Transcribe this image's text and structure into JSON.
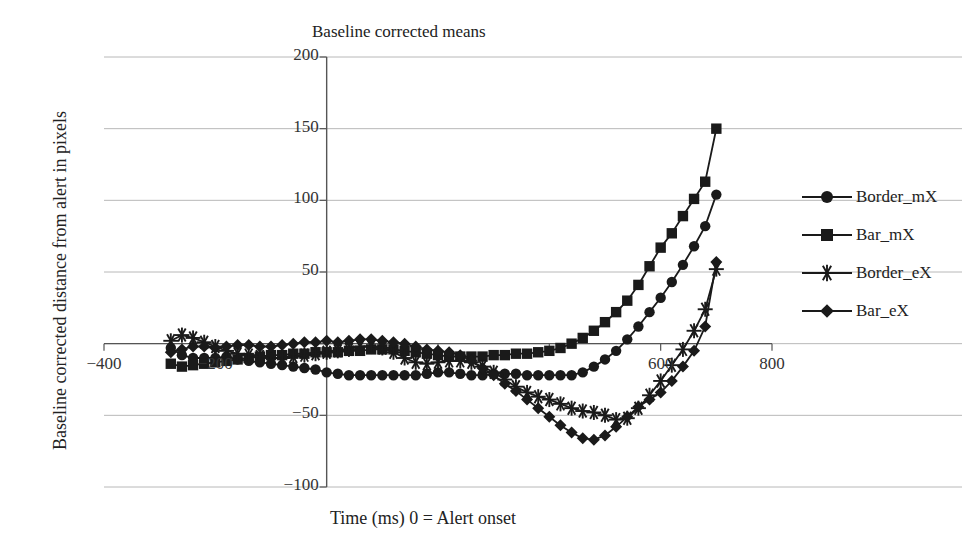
{
  "chart_data": {
    "type": "line",
    "title": "Baseline corrected means",
    "xlabel": "Time (ms) 0 = Alert onset",
    "ylabel": "Baseline corrected distance from alert in pixels",
    "xlim": [
      -400,
      800
    ],
    "ylim": [
      -100,
      200
    ],
    "xticks": [
      -400,
      -200,
      0,
      200,
      400,
      600,
      800
    ],
    "xtick_labels": [
      "-400",
      "-200",
      "",
      "",
      "",
      "600",
      "800"
    ],
    "yticks": [
      -100,
      -50,
      0,
      50,
      100,
      150,
      200
    ],
    "ytick_labels": [
      "-100",
      "-50",
      "",
      "50",
      "100",
      "150",
      "200"
    ],
    "grid": true,
    "legend_position": "right",
    "x": [
      -280,
      -260,
      -240,
      -220,
      -200,
      -180,
      -160,
      -140,
      -120,
      -100,
      -80,
      -60,
      -40,
      -20,
      0,
      20,
      40,
      60,
      80,
      100,
      120,
      140,
      160,
      180,
      200,
      220,
      240,
      260,
      280,
      300,
      320,
      340,
      360,
      380,
      400,
      420,
      440,
      460,
      480,
      500,
      520,
      540,
      560,
      580,
      600,
      620,
      640,
      660,
      680,
      700
    ],
    "series": [
      {
        "name": "Border_mX",
        "marker": "circle",
        "values": [
          -3,
          -8,
          -10,
          -10,
          -10,
          -9,
          -11,
          -12,
          -13,
          -14,
          -15,
          -16,
          -17,
          -18,
          -20,
          -21,
          -22,
          -22,
          -22,
          -22,
          -22,
          -22,
          -22,
          -21,
          -20,
          -20,
          -21,
          -22,
          -22,
          -21,
          -21,
          -21,
          -22,
          -22,
          -22,
          -22,
          -22,
          -20,
          -16,
          -11,
          -5,
          3,
          12,
          22,
          32,
          43,
          55,
          68,
          82,
          104
        ]
      },
      {
        "name": "Bar_mX",
        "marker": "square",
        "values": [
          -14,
          -16,
          -15,
          -14,
          -13,
          -12,
          -11,
          -10,
          -9,
          -8,
          -8,
          -7,
          -7,
          -6,
          -6,
          -6,
          -5,
          -5,
          -4,
          -4,
          -4,
          -5,
          -6,
          -7,
          -8,
          -9,
          -9,
          -9,
          -9,
          -8,
          -8,
          -7,
          -7,
          -6,
          -5,
          -3,
          0,
          4,
          9,
          15,
          22,
          30,
          41,
          54,
          67,
          77,
          89,
          101,
          113,
          150
        ]
      },
      {
        "name": "Border_eX",
        "marker": "star",
        "values": [
          2,
          6,
          4,
          1,
          -2,
          -5,
          -7,
          -8,
          -9,
          -10,
          -10,
          -9,
          -8,
          -7,
          -6,
          -5,
          -4,
          -2,
          -2,
          -3,
          -6,
          -10,
          -13,
          -14,
          -13,
          -12,
          -12,
          -13,
          -16,
          -20,
          -25,
          -30,
          -34,
          -37,
          -39,
          -42,
          -45,
          -47,
          -48,
          -50,
          -53,
          -52,
          -45,
          -36,
          -26,
          -15,
          -4,
          9,
          24,
          52
        ]
      },
      {
        "name": "Bar_eX",
        "marker": "diamond",
        "values": [
          -6,
          -4,
          -2,
          -2,
          -3,
          -2,
          -1,
          -1,
          -2,
          -2,
          -1,
          0,
          1,
          1,
          2,
          1,
          2,
          3,
          3,
          2,
          1,
          0,
          -2,
          -4,
          -5,
          -6,
          -8,
          -12,
          -17,
          -22,
          -28,
          -33,
          -39,
          -45,
          -51,
          -57,
          -62,
          -66,
          -67,
          -64,
          -58,
          -51,
          -44,
          -39,
          -34,
          -26,
          -16,
          -5,
          12,
          57
        ]
      }
    ]
  },
  "legend": {
    "items": [
      {
        "label": "Border_mX",
        "marker": "circle"
      },
      {
        "label": "Bar_mX",
        "marker": "square"
      },
      {
        "label": "Border_eX",
        "marker": "star"
      },
      {
        "label": "Bar_eX",
        "marker": "diamond"
      }
    ]
  },
  "colors": {
    "line": "#1a1a1a",
    "grid": "#b8b8b8",
    "axis": "#555555",
    "text": "#222222",
    "background": "#ffffff"
  }
}
